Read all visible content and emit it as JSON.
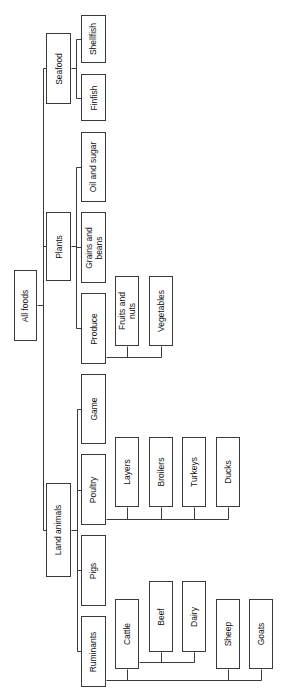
{
  "diagram": {
    "type": "tree",
    "orientation": "rotated-90-ccw",
    "line_color": "#3a3a3a",
    "root": "All foods",
    "nodes": [
      {
        "id": "all-foods",
        "label": "All foods",
        "parent": null,
        "x": 14,
        "y": 270,
        "w": 23,
        "h": 71
      },
      {
        "id": "seafood",
        "label": "Seafood",
        "parent": "all-foods",
        "x": 46,
        "y": 33,
        "w": 25,
        "h": 71
      },
      {
        "id": "plants",
        "label": "Plants",
        "parent": "all-foods",
        "x": 46,
        "y": 212,
        "w": 25,
        "h": 69
      },
      {
        "id": "land-animals",
        "label": "Land animals",
        "parent": "all-foods",
        "x": 46,
        "y": 483,
        "w": 25,
        "h": 94
      },
      {
        "id": "shellfish",
        "label": "Shellfish",
        "parent": "seafood",
        "x": 81,
        "y": 15,
        "w": 25,
        "h": 48
      },
      {
        "id": "finfish",
        "label": "Finfish",
        "parent": "seafood",
        "x": 81,
        "y": 74,
        "w": 25,
        "h": 47
      },
      {
        "id": "oil-and-sugar",
        "label": "Oil and sugar",
        "parent": "plants",
        "x": 81,
        "y": 132,
        "w": 25,
        "h": 70
      },
      {
        "id": "grains-and-beans",
        "label": "Grains and\nbeans",
        "parent": "plants",
        "x": 81,
        "y": 212,
        "w": 25,
        "h": 71
      },
      {
        "id": "produce",
        "label": "Produce",
        "parent": "plants",
        "x": 81,
        "y": 293,
        "w": 25,
        "h": 71
      },
      {
        "id": "fruits-and-nuts",
        "label": "Fruits and\nnuts",
        "parent": "produce",
        "x": 115,
        "y": 276,
        "w": 24,
        "h": 70
      },
      {
        "id": "vegetables",
        "label": "Vegetables",
        "parent": "produce",
        "x": 149,
        "y": 276,
        "w": 24,
        "h": 70
      },
      {
        "id": "game",
        "label": "Game",
        "parent": "land-animals",
        "x": 81,
        "y": 374,
        "w": 25,
        "h": 70
      },
      {
        "id": "poultry",
        "label": "Poultry",
        "parent": "land-animals",
        "x": 81,
        "y": 454,
        "w": 25,
        "h": 71
      },
      {
        "id": "pigs",
        "label": "Pigs",
        "parent": "land-animals",
        "x": 81,
        "y": 535,
        "w": 25,
        "h": 71
      },
      {
        "id": "ruminants",
        "label": "Ruminants",
        "parent": "land-animals",
        "x": 81,
        "y": 616,
        "w": 25,
        "h": 71
      },
      {
        "id": "layers",
        "label": "Layers",
        "parent": "poultry",
        "x": 115,
        "y": 437,
        "w": 24,
        "h": 70
      },
      {
        "id": "broilers",
        "label": "Broilers",
        "parent": "poultry",
        "x": 149,
        "y": 437,
        "w": 24,
        "h": 70
      },
      {
        "id": "turkeys",
        "label": "Turkeys",
        "parent": "poultry",
        "x": 182,
        "y": 437,
        "w": 24,
        "h": 70
      },
      {
        "id": "ducks",
        "label": "Ducks",
        "parent": "poultry",
        "x": 216,
        "y": 437,
        "w": 24,
        "h": 70
      },
      {
        "id": "cattle",
        "label": "Cattle",
        "parent": "ruminants",
        "x": 115,
        "y": 599,
        "w": 24,
        "h": 70
      },
      {
        "id": "beef",
        "label": "Beef",
        "parent": "cattle",
        "x": 149,
        "y": 581,
        "w": 24,
        "h": 71
      },
      {
        "id": "dairy",
        "label": "Dairy",
        "parent": "cattle",
        "x": 182,
        "y": 581,
        "w": 24,
        "h": 71
      },
      {
        "id": "sheep",
        "label": "Sheep",
        "parent": "ruminants",
        "x": 216,
        "y": 599,
        "w": 24,
        "h": 70
      },
      {
        "id": "goats",
        "label": "Goats",
        "parent": "ruminants",
        "x": 249,
        "y": 599,
        "w": 24,
        "h": 70
      }
    ],
    "connectors": [
      {
        "id": "root-stub",
        "points": [
          [
            37,
            305
          ],
          [
            43,
            305
          ]
        ]
      },
      {
        "id": "root-bus",
        "points": [
          [
            43,
            68
          ],
          [
            43,
            530
          ]
        ]
      },
      {
        "id": "to-seafood",
        "points": [
          [
            43,
            68
          ],
          [
            46,
            68
          ]
        ]
      },
      {
        "id": "to-plants",
        "points": [
          [
            43,
            246
          ],
          [
            46,
            246
          ]
        ]
      },
      {
        "id": "to-land-animals",
        "points": [
          [
            43,
            530
          ],
          [
            46,
            530
          ]
        ]
      },
      {
        "id": "seafood-stub",
        "points": [
          [
            71,
            68
          ],
          [
            76,
            68
          ]
        ]
      },
      {
        "id": "seafood-bus",
        "points": [
          [
            76,
            39
          ],
          [
            76,
            98
          ]
        ]
      },
      {
        "id": "to-shellfish",
        "points": [
          [
            76,
            39
          ],
          [
            81,
            39
          ]
        ]
      },
      {
        "id": "to-finfish",
        "points": [
          [
            76,
            98
          ],
          [
            81,
            98
          ]
        ]
      },
      {
        "id": "plants-stub",
        "points": [
          [
            71,
            246
          ],
          [
            76,
            246
          ]
        ]
      },
      {
        "id": "plants-bus",
        "points": [
          [
            76,
            167
          ],
          [
            76,
            328
          ]
        ]
      },
      {
        "id": "to-oil-and-sugar",
        "points": [
          [
            76,
            167
          ],
          [
            81,
            167
          ]
        ]
      },
      {
        "id": "to-grains",
        "points": [
          [
            76,
            247
          ],
          [
            81,
            247
          ]
        ]
      },
      {
        "id": "to-produce",
        "points": [
          [
            76,
            328
          ],
          [
            81,
            328
          ]
        ]
      },
      {
        "id": "produce-bus",
        "points": [
          [
            106,
            357
          ],
          [
            161,
            357
          ]
        ]
      },
      {
        "id": "to-fruits",
        "points": [
          [
            127,
            346
          ],
          [
            127,
            357
          ]
        ]
      },
      {
        "id": "to-vegetables",
        "points": [
          [
            161,
            346
          ],
          [
            161,
            357
          ]
        ]
      },
      {
        "id": "land-stub",
        "points": [
          [
            71,
            530
          ],
          [
            77,
            530
          ]
        ]
      },
      {
        "id": "land-bus",
        "points": [
          [
            77,
            409
          ],
          [
            77,
            651
          ]
        ]
      },
      {
        "id": "to-game",
        "points": [
          [
            77,
            409
          ],
          [
            81,
            409
          ]
        ]
      },
      {
        "id": "to-poultry",
        "points": [
          [
            77,
            490
          ],
          [
            81,
            490
          ]
        ]
      },
      {
        "id": "to-pigs",
        "points": [
          [
            77,
            570
          ],
          [
            81,
            570
          ]
        ]
      },
      {
        "id": "to-ruminants",
        "points": [
          [
            77,
            651
          ],
          [
            81,
            651
          ]
        ]
      },
      {
        "id": "poultry-bus",
        "points": [
          [
            106,
            519
          ],
          [
            228,
            519
          ]
        ]
      },
      {
        "id": "to-layers",
        "points": [
          [
            127,
            507
          ],
          [
            127,
            519
          ]
        ]
      },
      {
        "id": "to-broilers",
        "points": [
          [
            161,
            507
          ],
          [
            161,
            519
          ]
        ]
      },
      {
        "id": "to-turkeys",
        "points": [
          [
            194,
            507
          ],
          [
            194,
            519
          ]
        ]
      },
      {
        "id": "to-ducks",
        "points": [
          [
            228,
            507
          ],
          [
            228,
            519
          ]
        ]
      },
      {
        "id": "ruminants-bus",
        "points": [
          [
            106,
            680
          ],
          [
            261,
            680
          ]
        ]
      },
      {
        "id": "to-cattle",
        "points": [
          [
            127,
            669
          ],
          [
            127,
            680
          ]
        ]
      },
      {
        "id": "to-sheep",
        "points": [
          [
            228,
            669
          ],
          [
            228,
            680
          ]
        ]
      },
      {
        "id": "to-goats",
        "points": [
          [
            261,
            669
          ],
          [
            261,
            680
          ]
        ]
      },
      {
        "id": "cattle-bus",
        "points": [
          [
            139,
            662
          ],
          [
            194,
            662
          ]
        ]
      },
      {
        "id": "to-beef",
        "points": [
          [
            161,
            652
          ],
          [
            161,
            662
          ]
        ]
      },
      {
        "id": "to-dairy",
        "points": [
          [
            194,
            652
          ],
          [
            194,
            662
          ]
        ]
      }
    ]
  }
}
